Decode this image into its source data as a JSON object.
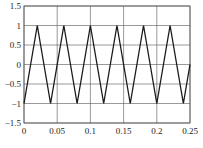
{
  "chart_data": {
    "type": "line",
    "title": "",
    "xlabel": "",
    "ylabel": "",
    "xlim": [
      0,
      0.25
    ],
    "ylim": [
      -1.5,
      1.5
    ],
    "grid": true,
    "legend": null,
    "x_ticks": [
      0,
      0.05,
      0.1,
      0.15,
      0.2,
      0.25
    ],
    "x_tick_labels": [
      "0",
      "0.05",
      "0.1",
      "0.15",
      "0.2",
      "0.25"
    ],
    "y_ticks": [
      1.5,
      1,
      0.5,
      0,
      -0.5,
      -1,
      -1.5
    ],
    "y_tick_labels": [
      "1.5",
      "1",
      "0.5",
      "0",
      "−0.5",
      "−1",
      "−1.5"
    ],
    "series": [
      {
        "name": "triangle wave",
        "color": "#1a1a1a",
        "x": [
          0,
          0.02,
          0.04,
          0.06,
          0.08,
          0.1,
          0.12,
          0.14,
          0.16,
          0.18,
          0.2,
          0.22,
          0.24,
          0.25
        ],
        "y": [
          -1,
          1,
          -1,
          1,
          -1,
          1,
          -1,
          1,
          -1,
          1,
          -1,
          1,
          -1,
          0
        ]
      }
    ]
  },
  "caption": "",
  "colors": {
    "grid": "#555555",
    "frame": "#555555",
    "line": "#1a1a1a",
    "background": "#ffffff"
  }
}
